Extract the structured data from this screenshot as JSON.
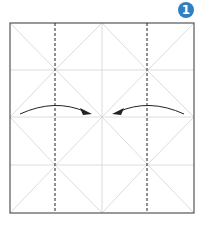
{
  "step": {
    "number": "1",
    "badge_color": "#2f7fc1"
  },
  "diagram": {
    "paper": {
      "x": 10,
      "y": 23,
      "width": 184,
      "height": 190
    },
    "colors": {
      "outline": "#555555",
      "crease": "#cfcfcf",
      "valley": "#222222",
      "arrow": "#222222"
    },
    "valley_folds_x": [
      55,
      147
    ],
    "arrows": [
      {
        "direction": "right",
        "from": [
          20,
          114
        ],
        "to": [
          91,
          113
        ]
      },
      {
        "direction": "left",
        "from": [
          184,
          114
        ],
        "to": [
          113,
          113
        ]
      }
    ]
  }
}
